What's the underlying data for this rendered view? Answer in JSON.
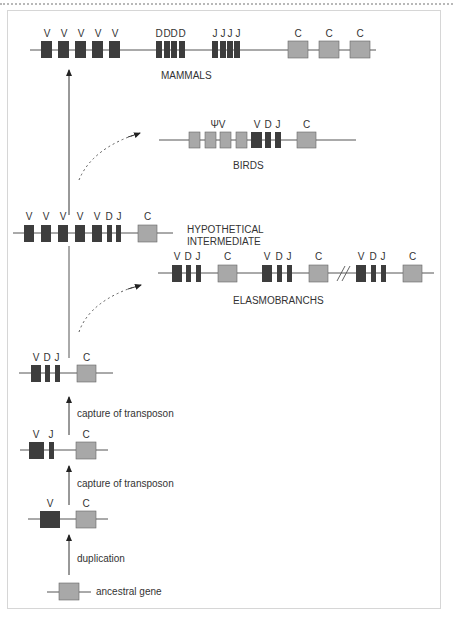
{
  "colors": {
    "segment_dark": "#3d3d3d",
    "segment_constant": "#a8a8a8",
    "line": "#555555",
    "frame": "#d6d6d6"
  },
  "rows": {
    "mammals": {
      "label": "MAMMALS",
      "segments": [
        "V",
        "V",
        "V",
        "V",
        "V",
        "D",
        "D",
        "D",
        "D",
        "J",
        "J",
        "J",
        "J",
        "C",
        "C",
        "C"
      ]
    },
    "birds": {
      "label": "BIRDS",
      "pseudo_label": "ΨV",
      "segments": [
        "ΨV",
        "ΨV",
        "ΨV",
        "ΨV",
        "V",
        "D",
        "J",
        "C"
      ]
    },
    "hypothetical": {
      "label_line1": "HYPOTHETICAL",
      "label_line2": "INTERMEDIATE",
      "segments": [
        "V",
        "V",
        "V",
        "V",
        "V",
        "D",
        "J",
        "C"
      ]
    },
    "elasmobranchs": {
      "label": "ELASMOBRANCHS",
      "clusters": [
        [
          "V",
          "D",
          "J",
          "C"
        ],
        [
          "V",
          "D",
          "J",
          "C"
        ],
        [
          "V",
          "D",
          "J",
          "C"
        ]
      ],
      "break_mark": "//"
    },
    "vdjc": {
      "segments": [
        "V",
        "D",
        "J",
        "C"
      ]
    },
    "vjc": {
      "segments": [
        "V",
        "J",
        "C"
      ]
    },
    "vc": {
      "segments": [
        "V",
        "C"
      ]
    },
    "ancestral": {
      "label": "ancestral gene"
    }
  },
  "steps": {
    "step1": "duplication",
    "step2": "capture of transposon",
    "step3": "capture of transposon"
  },
  "letters": {
    "V": "V",
    "D": "D",
    "J": "J",
    "C": "C"
  }
}
